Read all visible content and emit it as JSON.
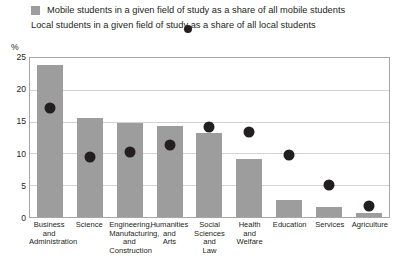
{
  "legend": {
    "items": [
      {
        "marker": "square-marker",
        "label": "Mobile students in a given field of study as a share of all mobile students",
        "color": "#9d9d9d"
      },
      {
        "marker": "circle-marker",
        "label": "Local students in a given field of study as a share of all local students",
        "color": "#231f20"
      }
    ]
  },
  "axis": {
    "unit_label": "%",
    "y_ticks": [
      "25",
      "20",
      "15",
      "10",
      "5",
      "0"
    ]
  },
  "chart_data": {
    "type": "bar",
    "title": "",
    "subtitle": "",
    "xlabel": "",
    "ylabel": "%",
    "ylim": [
      0,
      25
    ],
    "yticks": [
      0,
      5,
      10,
      15,
      20,
      25
    ],
    "grid": true,
    "legend_position": "top-left",
    "categories": [
      "Business and Administration",
      "Science",
      "Engineering, Manufacturing, and Construction",
      "Humanities and Arts",
      "Social Sciences and Law",
      "Health and Welfare",
      "Education",
      "Services",
      "Agriculture"
    ],
    "category_lines": [
      [
        "Business",
        "and",
        "Administration"
      ],
      [
        "Science"
      ],
      [
        "Engineering,",
        "Manufacturing,",
        "and Construction"
      ],
      [
        "Humanities",
        "and",
        "Arts"
      ],
      [
        "Social",
        "Sciences",
        "and",
        "Law"
      ],
      [
        "Health",
        "and",
        "Welfare"
      ],
      [
        "Education"
      ],
      [
        "Services"
      ],
      [
        "Agriculture"
      ]
    ],
    "series": [
      {
        "name": "Mobile students in a given field of study as a share of all mobile students",
        "type": "bar",
        "color": "#9d9d9d",
        "values": [
          23.9,
          15.5,
          14.8,
          14.3,
          13.2,
          9.2,
          2.6,
          1.6,
          0.6
        ]
      },
      {
        "name": "Local students in a given field of study as a share of all local students",
        "type": "scatter",
        "color": "#231f20",
        "values": [
          17.2,
          9.5,
          10.2,
          11.3,
          14.1,
          13.4,
          9.7,
          5.0,
          1.8
        ]
      }
    ]
  }
}
